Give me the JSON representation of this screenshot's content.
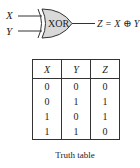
{
  "gate": {
    "input_x": "X",
    "input_y": "Y",
    "gate_label": "XOR",
    "output": "Z = X ⊕ Y",
    "fill_color": "#d9d9d9"
  },
  "truth_table": {
    "headers": [
      "X",
      "Y",
      "Z"
    ],
    "rows": [
      [
        "0",
        "0",
        "0"
      ],
      [
        "0",
        "1",
        "1"
      ],
      [
        "1",
        "0",
        "1"
      ],
      [
        "1",
        "1",
        "0"
      ]
    ]
  },
  "caption": "Truth table"
}
